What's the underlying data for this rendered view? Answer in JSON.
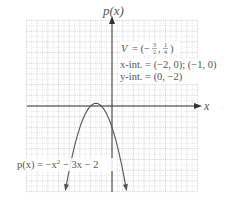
{
  "chart_data": {
    "type": "line",
    "title": "",
    "xlabel": "x",
    "ylabel": "p(x)",
    "xlim": [
      -8,
      8
    ],
    "ylim": [
      -8,
      8
    ],
    "grid": true,
    "grid_step": 1,
    "series": [
      {
        "name": "p(x) = -x^2 - 3x - 2",
        "function": "-x^2 - 3x - 2",
        "x": [
          -4.3,
          -4,
          -3.5,
          -3,
          -2.5,
          -2,
          -1.5,
          -1,
          -0.5,
          0,
          0.5,
          1,
          1.3
        ],
        "values": [
          -7.59,
          -6,
          -4.25,
          -2,
          -0.75,
          0,
          0.25,
          0,
          -0.75,
          -2,
          -3.75,
          -6,
          -7.59
        ]
      }
    ],
    "annotations": {
      "vertex": "V = (-3/2, 1/4)",
      "x_intercepts": "x-int. = (-2, 0); (-1, 0)",
      "y_intercept": "y-int. = (0, -2)",
      "curve_label": "p(x) = -x² - 3x - 2"
    }
  },
  "labels": {
    "y_axis": "p(x)",
    "x_axis": "x",
    "vertex_prefix": "V = (−",
    "vertex_frac1_num": "3",
    "vertex_frac1_den": "2",
    "vertex_sep": ",",
    "vertex_frac2_num": "1",
    "vertex_frac2_den": "4",
    "vertex_close": ")",
    "xint": "x-int. = (−2, 0); (−1, 0)",
    "yint": "y-int. = (0, −2)",
    "curve_lhs": "p(x) = −x",
    "curve_exp": "2",
    "curve_rhs": " − 3x − 2"
  },
  "colors": {
    "grid_solid": "#b8b8b8",
    "grid_dotted": "#cfcfcf",
    "axis": "#333333",
    "curve": "#555555",
    "text": "#555555"
  }
}
